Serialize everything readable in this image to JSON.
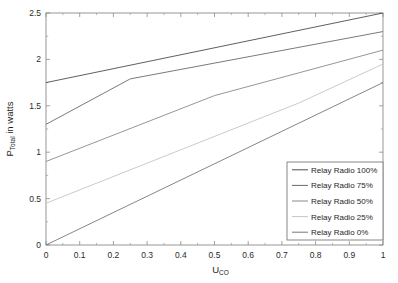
{
  "chart_data": {
    "type": "line",
    "title": "",
    "subtitle": "",
    "xlabel": "U_CO",
    "xlabel_base": "U",
    "xlabel_sub": "CO",
    "ylabel": "P_Total in watts",
    "ylabel_base": "P",
    "ylabel_sub": "Total",
    "ylabel_rest": " in watts",
    "xlim": [
      0,
      1
    ],
    "ylim": [
      0,
      2.5
    ],
    "xticks": [
      0,
      0.1,
      0.2,
      0.3,
      0.4,
      0.5,
      0.6,
      0.7,
      0.8,
      0.9,
      1
    ],
    "xticklabels": [
      "0",
      "0.1",
      "0.2",
      "0.3",
      "0.4",
      "0.5",
      "0.6",
      "0.7",
      "0.8",
      "0.9",
      "1"
    ],
    "yticks": [
      0,
      0.5,
      1,
      1.5,
      2,
      2.5
    ],
    "yticklabels": [
      "0",
      "0.5",
      "1",
      "1.5",
      "2",
      "2.5"
    ],
    "yminorticks": [
      0.25,
      0.75,
      1.25,
      1.75,
      2.25
    ],
    "grid": false,
    "legend_position": "lower right",
    "series": [
      {
        "name": "Relay Radio 100%",
        "color": "#4d4d4d",
        "x": [
          0,
          1
        ],
        "y": [
          1.75,
          2.5
        ]
      },
      {
        "name": "Relay Radio 75%",
        "color": "#6b6b6b",
        "x": [
          0,
          0.25,
          1
        ],
        "y": [
          1.3,
          1.79,
          2.3
        ]
      },
      {
        "name": "Relay Radio 50%",
        "color": "#8a8a8a",
        "x": [
          0,
          0.5,
          1
        ],
        "y": [
          0.9,
          1.61,
          2.1
        ]
      },
      {
        "name": "Relay Radio 25%",
        "color": "#c4c4c4",
        "x": [
          0,
          0.75,
          1
        ],
        "y": [
          0.45,
          1.53,
          1.95
        ]
      },
      {
        "name": "Relay Radio 0%",
        "color": "#777777",
        "x": [
          0,
          1
        ],
        "y": [
          0.0,
          1.75
        ]
      }
    ]
  },
  "legend": {
    "items": [
      {
        "label": "Relay Radio 100%",
        "color": "#4d4d4d"
      },
      {
        "label": "Relay Radio 75%",
        "color": "#6b6b6b"
      },
      {
        "label": "Relay Radio 50%",
        "color": "#8a8a8a"
      },
      {
        "label": "Relay Radio 25%",
        "color": "#c4c4c4"
      },
      {
        "label": "Relay Radio 0%",
        "color": "#777777"
      }
    ],
    "border_color": "#7a7a7a",
    "background": "#ffffff"
  },
  "axes": {
    "frame_color": "#8c8c8c",
    "text_color": "#1d1d1d"
  }
}
